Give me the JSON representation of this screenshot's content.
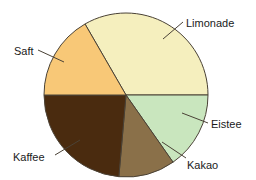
{
  "chart_data": {
    "type": "pie",
    "title": "",
    "categories": [
      "Limonade",
      "Eistee",
      "Kakao",
      "Kaffee",
      "Saft"
    ],
    "values": [
      33.3,
      15.3,
      11.1,
      23.6,
      16.7
    ],
    "units": "percent",
    "legend_position": "callout-labels",
    "grid": false,
    "start_angle_deg": 330,
    "direction": "clockwise",
    "slices": [
      {
        "label": "Limonade",
        "value": 33.3,
        "angle_deg": 120,
        "start_deg": 330,
        "end_deg": 90,
        "color": "#f5efbe"
      },
      {
        "label": "Eistee",
        "value": 15.3,
        "angle_deg": 55,
        "start_deg": 90,
        "end_deg": 145,
        "color": "#c9e6be"
      },
      {
        "label": "Kakao",
        "value": 11.1,
        "angle_deg": 40,
        "start_deg": 145,
        "end_deg": 185,
        "color": "#8a7049"
      },
      {
        "label": "Kaffee",
        "value": 23.6,
        "angle_deg": 85,
        "start_deg": 185,
        "end_deg": 270,
        "color": "#4a2b0f"
      },
      {
        "label": "Saft",
        "value": 16.7,
        "angle_deg": 60,
        "start_deg": 270,
        "end_deg": 330,
        "color": "#f8c877"
      }
    ]
  },
  "labels": {
    "limonade": "Limonade",
    "saft": "Saft",
    "eistee": "Eistee",
    "kakao": "Kakao",
    "kaffee": "Kaffee"
  },
  "style": {
    "outline_color": "#4a4236",
    "background": "#ffffff",
    "text_color": "#1a1a1a"
  }
}
